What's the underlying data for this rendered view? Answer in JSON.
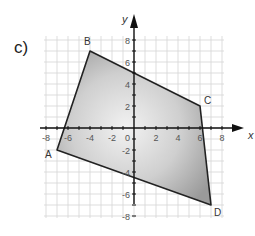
{
  "problem": {
    "label": "c)"
  },
  "axes": {
    "x_label": "x",
    "y_label": "y",
    "x_ticks": [
      "-8",
      "-6",
      "-4",
      "-2",
      "2",
      "4",
      "6",
      "8"
    ],
    "y_ticks": [
      "8",
      "6",
      "4",
      "2",
      "-2",
      "-4",
      "-6",
      "-8"
    ],
    "origin_label": "0",
    "range": [
      -8,
      8
    ]
  },
  "polygon": {
    "vertices": [
      {
        "name": "A",
        "x": -7,
        "y": -2
      },
      {
        "name": "B",
        "x": -4,
        "y": 7
      },
      {
        "name": "C",
        "x": 6,
        "y": 2
      },
      {
        "name": "D",
        "x": 7,
        "y": -7
      }
    ],
    "fill_light": "#e8e8e8",
    "fill_dark": "#9a9a9a",
    "stroke": "#222222"
  },
  "colors": {
    "grid": "#d4d4d4",
    "axis": "#111111"
  }
}
